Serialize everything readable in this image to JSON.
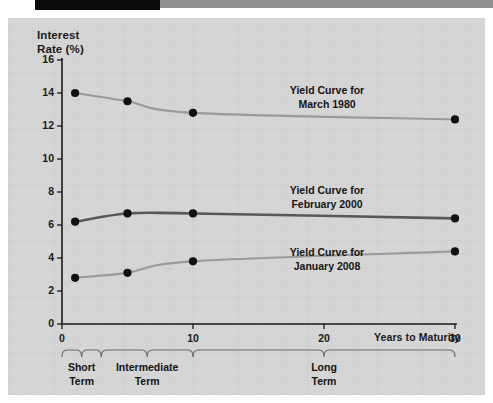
{
  "chart_data": {
    "type": "line",
    "title": "",
    "xlabel": "Years to Maturity",
    "ylabel": "Interest Rate (%)",
    "ylabel_line1": "Interest",
    "ylabel_line2": "Rate (%)",
    "xlim": [
      0,
      31
    ],
    "ylim": [
      0,
      16
    ],
    "grid": false,
    "legend_position": "inline-annotations",
    "yticks": [
      0,
      2,
      4,
      6,
      8,
      10,
      12,
      14,
      16
    ],
    "ytick_labels": [
      "0",
      "2",
      "4",
      "6",
      "8",
      "10",
      "12",
      "14",
      "16"
    ],
    "xticks": [
      0,
      10,
      20,
      30
    ],
    "xtick_labels": [
      "0",
      "10",
      "20",
      "30"
    ],
    "marker_x": [
      1,
      5,
      10,
      30
    ],
    "series": [
      {
        "name": "Yield Curve for March 1980",
        "label_line1": "Yield Curve for",
        "label_line2": "March 1980",
        "color": "#9a9a9a",
        "x": [
          1,
          5,
          10,
          30
        ],
        "values": [
          14.0,
          13.5,
          12.8,
          12.4
        ]
      },
      {
        "name": "Yield Curve for February 2000",
        "label_line1": "Yield Curve for",
        "label_line2": "February 2000",
        "color": "#585858",
        "x": [
          1,
          5,
          10,
          30
        ],
        "values": [
          6.2,
          6.7,
          6.7,
          6.4
        ]
      },
      {
        "name": "Yield Curve for January 2008",
        "label_line1": "Yield Curve for",
        "label_line2": "January 2008",
        "color": "#9a9a9a",
        "x": [
          1,
          5,
          10,
          30
        ],
        "values": [
          2.8,
          3.1,
          3.8,
          4.4
        ]
      }
    ],
    "maturity_brackets": [
      {
        "label_line1": "Short",
        "label_line2": "Term",
        "x_start": 0,
        "x_end": 3
      },
      {
        "label_line1": "Intermediate",
        "label_line2": "Term",
        "x_start": 3,
        "x_end": 10
      },
      {
        "label_line1": "Long",
        "label_line2": "Term",
        "x_start": 10,
        "x_end": 30
      }
    ]
  },
  "colors": {
    "panel_background": "#d5d5d5",
    "axis": "#1a1a1a",
    "marker": "#111111",
    "bracket": "#6b6b6b",
    "series_light": "#9a9a9a",
    "series_dark": "#585858",
    "topbar_black": "#0b0b0b",
    "topbar_gray": "#8e8e8e"
  }
}
